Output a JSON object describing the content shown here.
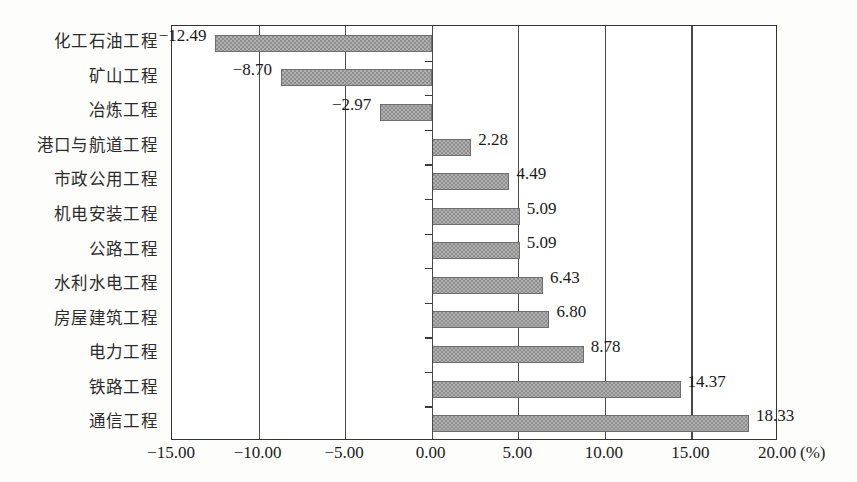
{
  "chart_data": {
    "type": "bar",
    "orientation": "horizontal",
    "title": "",
    "subtitle": "",
    "xlabel": "(%)",
    "ylabel": "",
    "xlim": [
      -15.0,
      20.0
    ],
    "xticks": [
      "-15.00",
      "-10.00",
      "-5.00",
      "0.00",
      "5.00",
      "10.00",
      "15.00",
      "20.00"
    ],
    "xtick_values": [
      -15.0,
      -10.0,
      -5.0,
      0.0,
      5.0,
      10.0,
      15.0,
      20.0
    ],
    "grid": true,
    "grid_axis": "x",
    "legend": null,
    "categories": [
      "化工石油工程",
      "矿山工程",
      "冶炼工程",
      "港口与航道工程",
      "市政公用工程",
      "机电安装工程",
      "公路工程",
      "水利水电工程",
      "房屋建筑工程",
      "电力工程",
      "铁路工程",
      "通信工程"
    ],
    "values": [
      -12.49,
      -8.7,
      -2.97,
      2.28,
      4.49,
      5.09,
      5.09,
      6.43,
      6.8,
      8.78,
      14.37,
      18.33
    ],
    "value_labels": [
      "−12.49",
      "−8.70",
      "−2.97",
      "2.28",
      "4.49",
      "5.09",
      "5.09",
      "6.43",
      "6.80",
      "8.78",
      "14.37",
      "18.33"
    ],
    "bar_color": "#8e8e8e",
    "bar_edge_color": "#6f6f6f",
    "axis_color": "#333333",
    "unit": "(%)"
  }
}
